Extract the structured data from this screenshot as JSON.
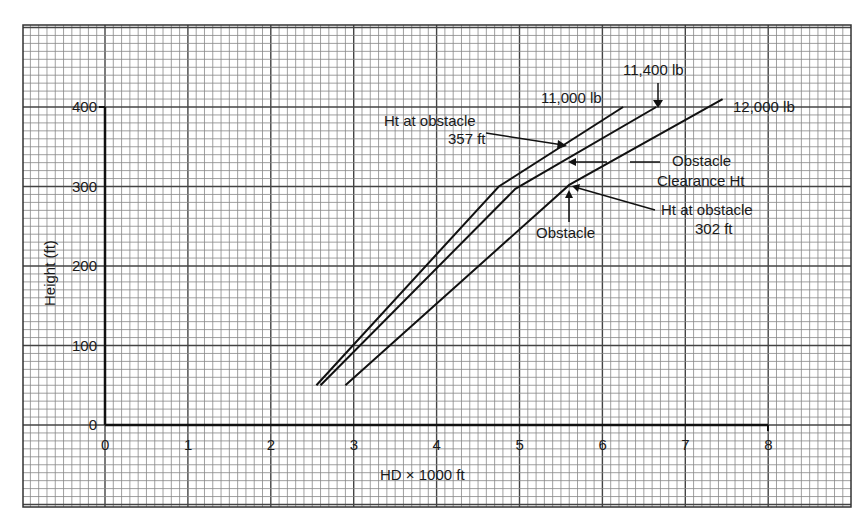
{
  "chart_data": {
    "type": "line",
    "title": "",
    "xlabel": "HD × 1000 ft",
    "ylabel": "Height (ft)",
    "xlim": [
      0,
      8
    ],
    "ylim": [
      0,
      400
    ],
    "x_ticks": [
      "0",
      "1",
      "2",
      "3",
      "4",
      "5",
      "6",
      "7",
      "8"
    ],
    "y_ticks": [
      "0",
      "100",
      "200",
      "300",
      "400"
    ],
    "grid": true,
    "series": [
      {
        "name": "11,000 lb",
        "points": [
          [
            2.55,
            50
          ],
          [
            4.75,
            300
          ],
          [
            6.25,
            400
          ]
        ]
      },
      {
        "name": "11,400 lb",
        "points": [
          [
            2.6,
            50
          ],
          [
            4.95,
            297
          ],
          [
            6.65,
            400
          ]
        ]
      },
      {
        "name": "12,000 lb",
        "points": [
          [
            2.9,
            50
          ],
          [
            5.6,
            302
          ],
          [
            7.45,
            410
          ]
        ]
      }
    ],
    "annotations": [
      {
        "text": "11,000 lb"
      },
      {
        "text": "11,400 lb"
      },
      {
        "text": "12,000 lb"
      },
      {
        "text_line1": "Ht at obstacle",
        "text_line2": "357 ft"
      },
      {
        "text_line1": "Obstacle",
        "text_line2": "Clearance Ht"
      },
      {
        "text_line1": "Ht at obstacle",
        "text_line2": "302 ft"
      },
      {
        "text": "Obstacle"
      }
    ]
  },
  "labels": {
    "xlabel": "HD × 1000 ft",
    "ylabel": "Height (ft)",
    "s1": "11,000 lb",
    "s2": "11,400 lb",
    "s3": "12,000 lb",
    "ann_357_l1": "Ht at obstacle",
    "ann_357_l2": "357 ft",
    "ann_clear_l1": "Obstacle",
    "ann_clear_l2": "Clearance Ht",
    "ann_302_l1": "Ht at obstacle",
    "ann_302_l2": "302 ft",
    "ann_obstacle": "Obstacle",
    "xt": [
      "0",
      "1",
      "2",
      "3",
      "4",
      "5",
      "6",
      "7",
      "8"
    ],
    "yt": [
      "0",
      "100",
      "200",
      "300",
      "400"
    ]
  }
}
